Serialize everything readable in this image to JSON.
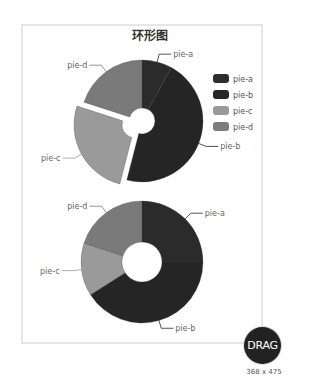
{
  "title": "环形图",
  "colors": {
    "pie-a": "#2b2b2b",
    "pie-b": "#252525",
    "pie-c": "#9a9a9a",
    "pie-d": "#7a7a7a"
  },
  "legend": [
    {
      "label": "pie-a",
      "color": "#2e2e2e"
    },
    {
      "label": "pie-b",
      "color": "#272727"
    },
    {
      "label": "pie-c",
      "color": "#9a9a9a"
    },
    {
      "label": "pie-d",
      "color": "#7c7c7c"
    }
  ],
  "drag_button": {
    "label": "DRAG"
  },
  "size_label": "368 x 475",
  "chart_data": [
    {
      "type": "pie",
      "variant": "donut",
      "title": "环形图",
      "categories": [
        "pie-a",
        "pie-b",
        "pie-c",
        "pie-d"
      ],
      "values": [
        8,
        46,
        26,
        20
      ],
      "selected": "pie-c",
      "legend_position": "right"
    },
    {
      "type": "pie",
      "variant": "donut",
      "categories": [
        "pie-a",
        "pie-b",
        "pie-c",
        "pie-d"
      ],
      "values": [
        25,
        41,
        14,
        20
      ]
    }
  ]
}
